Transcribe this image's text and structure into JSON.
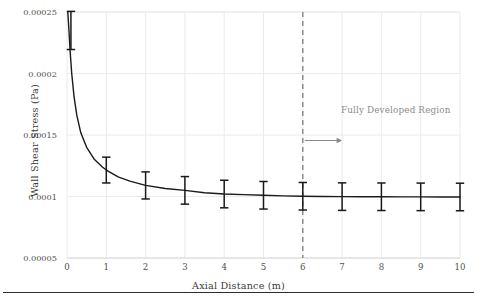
{
  "chart_data": {
    "type": "line",
    "title": "",
    "xlabel": "Axial Distance (m)",
    "ylabel": "Wall Shear Stress (Pa)",
    "xlim": [
      0,
      10
    ],
    "ylim": [
      5e-05,
      0.00025
    ],
    "grid": true,
    "legend": "none",
    "xticks": [
      0,
      1,
      2,
      3,
      4,
      5,
      6,
      7,
      8,
      9,
      10
    ],
    "xtick_labels": [
      "0",
      "1",
      "2",
      "3",
      "4",
      "5",
      "6",
      "7",
      "8",
      "9",
      "10"
    ],
    "yticks": [
      5e-05,
      0.0001,
      0.00015,
      0.0002,
      0.00025
    ],
    "ytick_labels": [
      "0.00005",
      "0.0001",
      "0.00015",
      "0.0002",
      "0.00025"
    ],
    "series": [
      {
        "name": "wall-shear-stress",
        "type": "line",
        "color": "#1a1a1a",
        "x": [
          0.02,
          0.05,
          0.08,
          0.12,
          0.18,
          0.25,
          0.35,
          0.5,
          0.7,
          0.9,
          1.0,
          1.3,
          1.6,
          2.0,
          2.5,
          3.0,
          3.5,
          4.0,
          4.5,
          5.0,
          5.5,
          6.0,
          6.5,
          7.0,
          7.5,
          8.0,
          8.5,
          9.0,
          9.5,
          10.0
        ],
        "y": [
          0.00025,
          0.000235,
          0.000218,
          0.0002,
          0.000181,
          0.000166,
          0.000152,
          0.00014,
          0.00013,
          0.000124,
          0.0001215,
          0.000116,
          0.0001125,
          0.000109,
          0.0001065,
          0.000105,
          0.000103,
          0.000102,
          0.0001015,
          0.000101,
          0.0001005,
          0.0001002,
          0.0001,
          9.99e-05,
          9.98e-05,
          9.98e-05,
          9.97e-05,
          9.97e-05,
          9.96e-05,
          9.96e-05
        ]
      }
    ],
    "errorbars": {
      "color": "#1a1a1a",
      "x": [
        0.1,
        1,
        2,
        3,
        4,
        5,
        6,
        7,
        8,
        9,
        10
      ],
      "y": [
        0.000235,
        0.0001215,
        0.000109,
        0.000105,
        0.000102,
        0.000101,
        0.0001002,
        9.99e-05,
        9.98e-05,
        9.97e-05,
        9.96e-05
      ],
      "yerr": [
        1.55e-05,
        1.05e-05,
        1.1e-05,
        1.12e-05,
        1.12e-05,
        1.12e-05,
        1.12e-05,
        1.12e-05,
        1.12e-05,
        1.12e-05,
        1.12e-05
      ]
    },
    "vline": {
      "x": 6,
      "style": "dashed",
      "color": "#7d7d7d"
    },
    "annotations": [
      {
        "text": "Fully Developed Region",
        "x": 6.05,
        "y": 0.0001455,
        "arrow_to_x": 7.0,
        "color": "#8a8a8a"
      }
    ]
  },
  "axis": {
    "xlabel": "Axial Distance (m)",
    "ylabel": "Wall Shear Stress (Pa)"
  }
}
